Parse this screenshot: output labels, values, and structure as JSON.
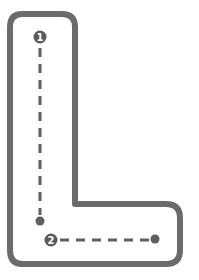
{
  "letter": "L",
  "colors": {
    "outline": "#6b6b6b",
    "guide": "#5f5f5f",
    "badge_bg": "#5a5a5a",
    "badge_text": "#ffffff",
    "background": "#ffffff"
  },
  "strokes": [
    {
      "number": "1",
      "direction": "down"
    },
    {
      "number": "2",
      "direction": "right"
    }
  ]
}
